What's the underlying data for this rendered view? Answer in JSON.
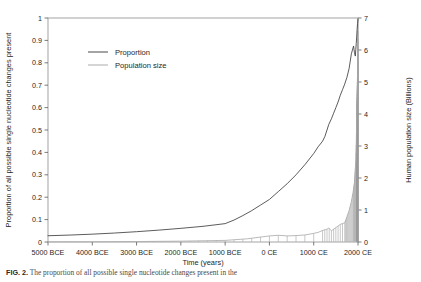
{
  "figure": {
    "caption_label": "FIG. 2.",
    "caption_text": "The proportion of all possible single nucleotide changes present in the"
  },
  "chart_data": {
    "type": "line",
    "title": "",
    "xlabel": "Time (years)",
    "ylabel": "Proportion of all possible single nucleotide changes present",
    "y2label": "Human population size (Billions)",
    "grid": false,
    "legend_position": "top-left",
    "xlim": [
      -5000,
      2000
    ],
    "ylim": [
      0,
      1
    ],
    "y2lim": [
      0,
      7
    ],
    "xticks": [
      -5000,
      -4000,
      -3000,
      -2000,
      -1000,
      0,
      1000,
      2000
    ],
    "xticklabels": [
      "5000 BCE",
      "4000 BCE",
      "3000 BCE",
      "2000 BCE",
      "1000 BCE",
      "0 CE",
      "1000 CE",
      "2000 CE"
    ],
    "yticks": [
      0,
      0.1,
      0.2,
      0.3,
      0.4,
      0.5,
      0.6,
      0.7,
      0.8,
      0.9,
      1
    ],
    "yticklabels": [
      "0",
      "0.1",
      "0.2",
      "0.3",
      "0.4",
      "0.5",
      "0.6",
      "0.7",
      "0.8",
      "0.9",
      "1"
    ],
    "y2ticks": [
      0,
      1,
      2,
      3,
      4,
      5,
      6,
      7
    ],
    "y2ticklabels": [
      "0",
      "1",
      "2",
      "3",
      "4",
      "5",
      "6",
      "7"
    ],
    "series": [
      {
        "name": "Proportion",
        "color": "#3f3f3f",
        "axis": "left",
        "x": [
          -5000,
          -4500,
          -4000,
          -3500,
          -3000,
          -2500,
          -2000,
          -1500,
          -1000,
          -800,
          -600,
          -400,
          -200,
          0,
          200,
          400,
          600,
          800,
          1000,
          1100,
          1200,
          1250,
          1300,
          1340,
          1400,
          1450,
          1500,
          1550,
          1600,
          1650,
          1700,
          1750,
          1800,
          1850,
          1900,
          1920,
          1940,
          1950,
          1960,
          1970,
          1980,
          1990,
          2000
        ],
        "values": [
          0.028,
          0.031,
          0.035,
          0.04,
          0.046,
          0.053,
          0.061,
          0.07,
          0.082,
          0.098,
          0.118,
          0.14,
          0.165,
          0.19,
          0.225,
          0.26,
          0.3,
          0.345,
          0.395,
          0.425,
          0.45,
          0.47,
          0.5,
          0.525,
          0.55,
          0.575,
          0.6,
          0.625,
          0.655,
          0.68,
          0.705,
          0.735,
          0.775,
          0.84,
          0.875,
          0.845,
          0.83,
          0.86,
          0.885,
          0.915,
          0.95,
          0.975,
          0.995
        ]
      },
      {
        "name": "Population size",
        "color": "#a8a8a8",
        "axis": "right",
        "x": [
          -5000,
          -4000,
          -3000,
          -2000,
          -1000,
          -500,
          0,
          200,
          400,
          600,
          800,
          1000,
          1100,
          1200,
          1300,
          1340,
          1400,
          1500,
          1600,
          1700,
          1750,
          1800,
          1850,
          1900,
          1920,
          1940,
          1950,
          1960,
          1970,
          1980,
          1990,
          2000
        ],
        "values": [
          0.005,
          0.007,
          0.014,
          0.027,
          0.05,
          0.1,
          0.19,
          0.21,
          0.19,
          0.2,
          0.22,
          0.27,
          0.3,
          0.36,
          0.4,
          0.44,
          0.35,
          0.45,
          0.55,
          0.6,
          0.79,
          0.98,
          1.26,
          1.65,
          1.86,
          2.3,
          2.53,
          3.03,
          3.7,
          4.45,
          5.3,
          7.0
        ]
      }
    ],
    "annotations": []
  },
  "legend": {
    "items": [
      {
        "label": "Proportion",
        "color": "#3f3f3f"
      },
      {
        "label": "Population size",
        "color": "#a8a8a8"
      }
    ]
  }
}
